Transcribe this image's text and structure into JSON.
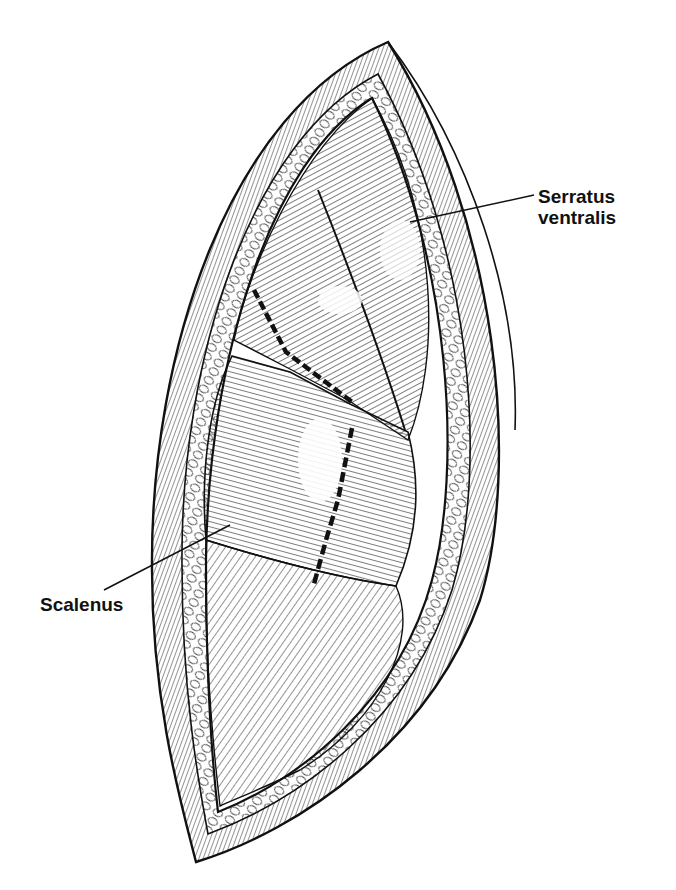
{
  "figure": {
    "type": "anatomical-illustration",
    "colors": {
      "ink": "#111111",
      "background": "#ffffff"
    }
  },
  "labels": {
    "serratus": {
      "line1": "Serratus",
      "line2": "ventralis"
    },
    "scalenus": {
      "text": "Scalenus"
    }
  }
}
